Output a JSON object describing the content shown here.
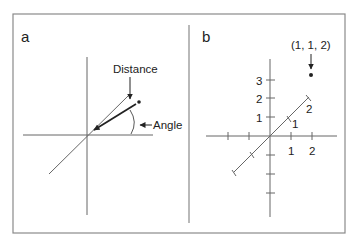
{
  "figure": {
    "border_color": "#8a8a8a",
    "line_color": "#555555",
    "text_color": "#222222"
  },
  "panel_a": {
    "letter": "a",
    "labels": {
      "distance": "Distance",
      "angle": "Angle"
    }
  },
  "panel_b": {
    "letter": "b",
    "point_label": "(1, 1, 2)",
    "y_ticks": [
      "1",
      "2",
      "3"
    ],
    "x_ticks": [
      "1",
      "2"
    ],
    "z_ticks": [
      "1",
      "2"
    ]
  }
}
